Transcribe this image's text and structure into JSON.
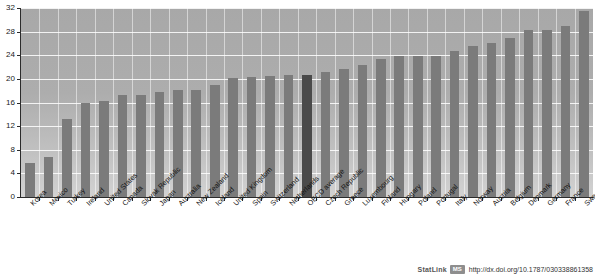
{
  "chart_data": {
    "type": "bar",
    "title": "",
    "xlabel": "",
    "ylabel": "",
    "ylim": [
      0,
      32
    ],
    "ytick_values": [
      0,
      4,
      8,
      12,
      16,
      20,
      24,
      28,
      32
    ],
    "ytick_labels": [
      "0",
      "4",
      "8",
      "12",
      "16",
      "20",
      "24",
      "28",
      "32"
    ],
    "grid": true,
    "legend": "none",
    "highlight_category": "OECD average",
    "highlight_color": "#4a4a4a",
    "bar_color": "#7b7b7b",
    "plot_background": "#adadad",
    "categories": [
      "Korea",
      "Mexico",
      "Turkey",
      "Ireland",
      "United States",
      "Canada",
      "Slovak Republic",
      "Japan",
      "Australia",
      "New Zealand",
      "Iceland",
      "United Kingdom",
      "Spain",
      "Switzerland",
      "Netherlands",
      "OECD average",
      "Czech Republic",
      "Greece",
      "Luxembourg",
      "Finland",
      "Hungary",
      "Poland",
      "Portugal",
      "Italy",
      "Norway",
      "Austria",
      "Belgium",
      "Denmark",
      "Germany",
      "France",
      "Sweden"
    ],
    "values": [
      5.7,
      6.8,
      13.2,
      15.9,
      16.2,
      17.3,
      17.3,
      17.8,
      18.1,
      18.2,
      18.9,
      20.1,
      20.4,
      20.5,
      20.7,
      20.6,
      21.1,
      21.7,
      22.3,
      23.3,
      23.8,
      23.9,
      23.9,
      24.7,
      25.5,
      26.0,
      27.0,
      28.2,
      28.3,
      29.0,
      31.5
    ]
  },
  "footer": {
    "statlink_label": "StatLink",
    "statlink_badge": "MS",
    "statlink_url": "http://dx.doi.org/10.1787/030338861358"
  }
}
